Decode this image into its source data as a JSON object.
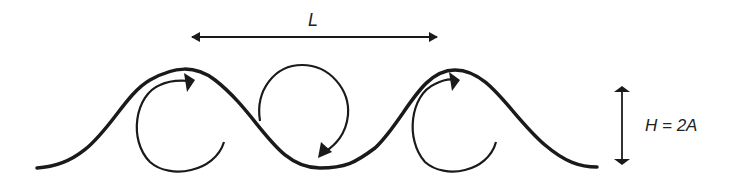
{
  "diagram": {
    "wavelength_label": "L",
    "height_label": "H = 2A",
    "colors": {
      "stroke": "#1a1a1a",
      "background": "#ffffff"
    },
    "elements": [
      "wave-profile",
      "wavelength-arrow",
      "height-arrow",
      "orbital-circulation-1",
      "orbital-circulation-2",
      "orbital-circulation-3"
    ]
  }
}
